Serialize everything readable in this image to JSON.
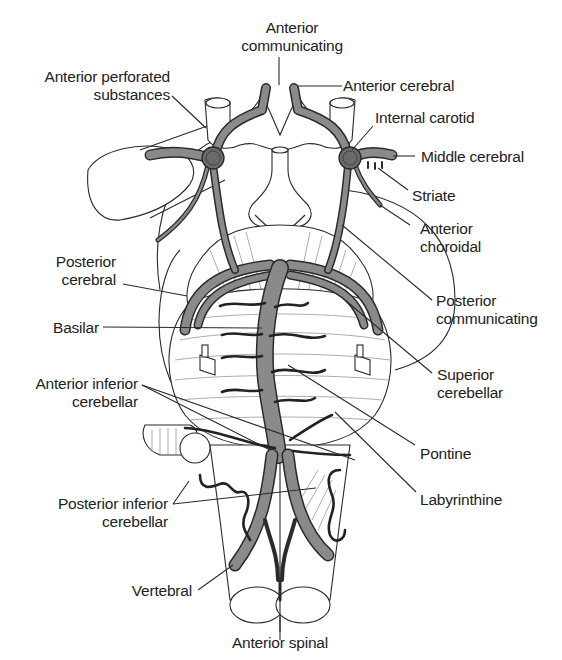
{
  "figure": {
    "colors": {
      "artery_fill": "#8a8a8a",
      "artery_outline": "#2a2a2a",
      "background": "#ffffff",
      "text": "#222222"
    }
  },
  "labels": {
    "anterior_communicating": {
      "line1": "Anterior",
      "line2": "communicating"
    },
    "anterior_cerebral": {
      "line1": "Anterior cerebral"
    },
    "anterior_perforated": {
      "line1": "Anterior perforated",
      "line2": "substances"
    },
    "internal_carotid": {
      "line1": "Internal carotid"
    },
    "middle_cerebral": {
      "line1": "Middle cerebral"
    },
    "striate": {
      "line1": "Striate"
    },
    "anterior_choroidal": {
      "line1": "Anterior",
      "line2": "choroidal"
    },
    "posterior_cerebral": {
      "line1": "Posterior",
      "line2": "cerebral"
    },
    "posterior_communicating": {
      "line1": "Posterior",
      "line2": "communicating"
    },
    "basilar": {
      "line1": "Basilar"
    },
    "superior_cerebellar": {
      "line1": "Superior",
      "line2": "cerebellar"
    },
    "anterior_inferior_cerebellar": {
      "line1": "Anterior inferior",
      "line2": "cerebellar"
    },
    "pontine": {
      "line1": "Pontine"
    },
    "labyrinthine": {
      "line1": "Labyrinthine"
    },
    "posterior_inferior_cerebellar": {
      "line1": "Posterior inferior",
      "line2": "cerebellar"
    },
    "vertebral": {
      "line1": "Vertebral"
    },
    "anterior_spinal": {
      "line1": "Anterior spinal"
    }
  }
}
